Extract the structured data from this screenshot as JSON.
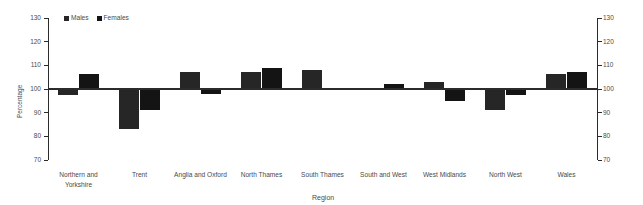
{
  "chart_data": {
    "type": "bar",
    "title": "",
    "xlabel": "Region",
    "ylabel": "Percentage",
    "ylim": [
      70,
      130
    ],
    "yticks": [
      70,
      80,
      90,
      100,
      110,
      120,
      130
    ],
    "ytick_labels": [
      "70",
      "80",
      "90",
      "100",
      "110",
      "120",
      "130"
    ],
    "baseline": 100,
    "grid": false,
    "legend_position": "top-left",
    "dual_axis": true,
    "categories": [
      "Northern and\nYorkshire",
      "Trent",
      "Anglia and Oxford",
      "North Thames",
      "South Thames",
      "South and West",
      "West Midlands",
      "North West",
      "Wales"
    ],
    "series": [
      {
        "name": "Males",
        "color": "#262626",
        "values": [
          97.5,
          83,
          107,
          107,
          108,
          99.8,
          103,
          91,
          106.5
        ]
      },
      {
        "name": "Females",
        "color": "#141414",
        "values": [
          106.5,
          91,
          98,
          109,
          100.5,
          102,
          95,
          97.5,
          107
        ]
      }
    ]
  },
  "legend": {
    "items": [
      {
        "label": "Males",
        "color": "#262626"
      },
      {
        "label": "Females",
        "color": "#141414"
      }
    ]
  },
  "axes": {
    "y_title": "Percentage",
    "x_title": "Region"
  }
}
